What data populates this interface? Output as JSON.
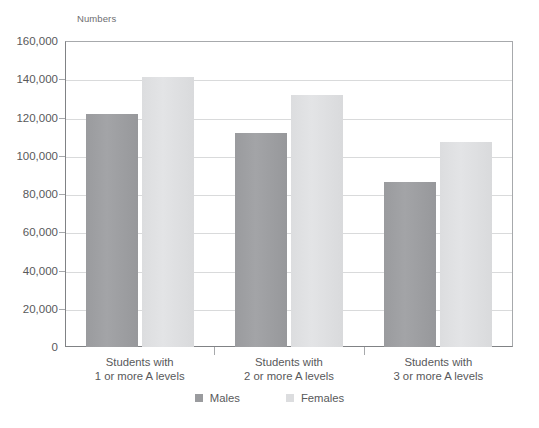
{
  "chart_data": {
    "type": "bar",
    "title": "",
    "subtitle": "",
    "axis_unit_label": "Numbers",
    "xlabel": "",
    "ylabel": "Numbers",
    "ylim": [
      0,
      160000
    ],
    "grid": true,
    "legend_position": "bottom-center",
    "categories": [
      "Students with\n1 or more A levels",
      "Students with\n2 or more A levels",
      "Students with\n3 or more A levels"
    ],
    "category_lines": [
      [
        "Students with",
        "1 or more A levels"
      ],
      [
        "Students with",
        "2 or more A levels"
      ],
      [
        "Students with",
        "3 or more A levels"
      ]
    ],
    "series": [
      {
        "name": "Males",
        "color": "#9a9b9e",
        "values": [
          122000,
          112000,
          86500
        ]
      },
      {
        "name": "Females",
        "color": "#dcdddf",
        "values": [
          141000,
          132000,
          107000
        ]
      }
    ],
    "y_ticks": [
      0,
      20000,
      40000,
      60000,
      80000,
      100000,
      120000,
      140000,
      160000
    ],
    "y_tick_labels": [
      "0",
      "20,000",
      "40,000",
      "60,000",
      "80,000",
      "100,000",
      "120,000",
      "140,000",
      "160,000"
    ]
  },
  "legend": {
    "items": [
      {
        "label": "Males",
        "swatch": "males-swatch"
      },
      {
        "label": "Females",
        "swatch": "females-swatch"
      }
    ]
  },
  "colors": {
    "males": "#9a9b9e",
    "females": "#dcdddf",
    "gridline": "#d9dadb",
    "axis": "#808285",
    "text": "#58595b"
  }
}
